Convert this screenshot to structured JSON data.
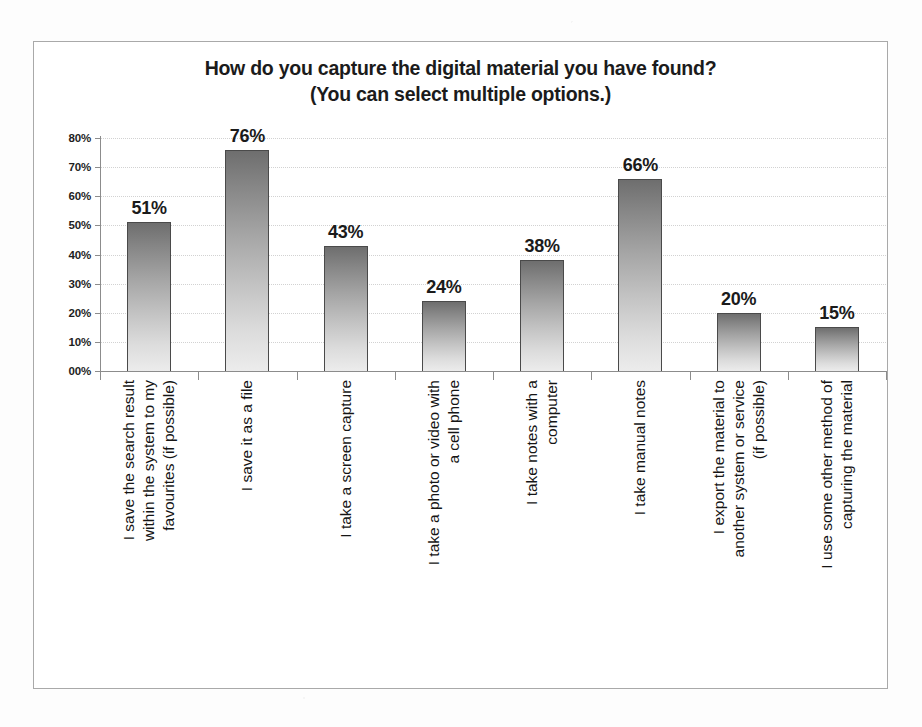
{
  "chart_data": {
    "type": "bar",
    "title": "How do you capture the digital material you have found?",
    "subtitle": "(You can select multiple options.)",
    "xlabel": "",
    "ylabel": "",
    "ylim": [
      0,
      80
    ],
    "grid": true,
    "legend_position": "none",
    "y_tick_labels": [
      "80%",
      "70%",
      "60%",
      "50%",
      "40%",
      "30%",
      "20%",
      "10%",
      "00%"
    ],
    "y_tick_values": [
      80,
      70,
      60,
      50,
      40,
      30,
      20,
      10,
      0
    ],
    "categories": [
      "I save the search result within the system to my favourites (if possible)",
      "I save it as a file",
      "I take a screen capture",
      "I take a photo or video with a cell phone",
      "I take notes with a computer",
      "I take manual notes",
      "I export the material to another system or service (if possible)",
      "I use some other method of capturing the material"
    ],
    "category_lines": [
      [
        "I save the search result",
        "within the system to my",
        "favourites (if possible)"
      ],
      [
        "I save it as a file"
      ],
      [
        "I take a screen capture"
      ],
      [
        "I take a photo or video with",
        "a cell phone"
      ],
      [
        "I take notes with a",
        "computer"
      ],
      [
        "I take manual notes"
      ],
      [
        "I export the material to",
        "another system or service",
        "(if possible)"
      ],
      [
        "I use some other method of",
        "capturing the material"
      ]
    ],
    "values": [
      51,
      76,
      43,
      24,
      38,
      66,
      20,
      15
    ],
    "data_labels": [
      "51%",
      "76%",
      "43%",
      "24%",
      "38%",
      "66%",
      "20%",
      "15%"
    ],
    "bar_fill_top_color": "#6e6e6e",
    "bar_fill_bottom_color": "#ececec",
    "bar_outline_color": "#4a4a4a",
    "gridline_color": "#d2d2d2",
    "axis_color": "#8c8c8c",
    "frame_border_color": "#a9a9a9",
    "text_color": "#1b1b1b"
  }
}
